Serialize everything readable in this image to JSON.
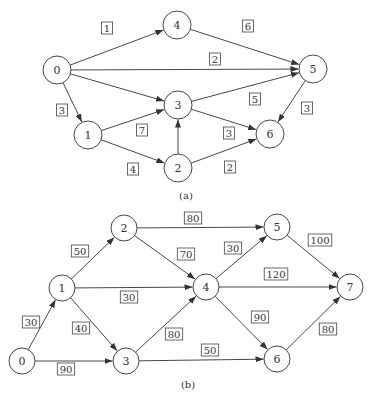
{
  "diagrams": [
    {
      "caption": "(a)",
      "caption_pos": [
        186,
        195
      ],
      "node_radius": 14,
      "nodes": [
        {
          "id": "0",
          "label": "0",
          "x": 57,
          "y": 70
        },
        {
          "id": "1",
          "label": "1",
          "x": 88,
          "y": 135
        },
        {
          "id": "2",
          "label": "2",
          "x": 178,
          "y": 168
        },
        {
          "id": "3",
          "label": "3",
          "x": 178,
          "y": 105
        },
        {
          "id": "4",
          "label": "4",
          "x": 177,
          "y": 25
        },
        {
          "id": "5",
          "label": "5",
          "x": 313,
          "y": 69
        },
        {
          "id": "6",
          "label": "6",
          "x": 270,
          "y": 134
        }
      ],
      "edges": [
        {
          "from": "0",
          "to": "4",
          "weight": "1",
          "lx": 107,
          "ly": 28
        },
        {
          "from": "4",
          "to": "5",
          "weight": "6",
          "lx": 248,
          "ly": 26
        },
        {
          "from": "0",
          "to": "5",
          "weight": "2",
          "lx": 215,
          "ly": 59
        },
        {
          "from": "0",
          "to": "1",
          "weight": "3",
          "lx": 62,
          "ly": 110
        },
        {
          "from": "0",
          "to": "3",
          "weight": "",
          "lx": 0,
          "ly": 0
        },
        {
          "from": "1",
          "to": "3",
          "weight": "7",
          "lx": 142,
          "ly": 130
        },
        {
          "from": "1",
          "to": "2",
          "weight": "4",
          "lx": 133,
          "ly": 169
        },
        {
          "from": "2",
          "to": "3",
          "weight": "",
          "lx": 0,
          "ly": 0
        },
        {
          "from": "3",
          "to": "5",
          "weight": "5",
          "lx": 255,
          "ly": 99
        },
        {
          "from": "3",
          "to": "6",
          "weight": "3",
          "lx": 229,
          "ly": 133
        },
        {
          "from": "5",
          "to": "6",
          "weight": "3",
          "lx": 307,
          "ly": 108
        },
        {
          "from": "2",
          "to": "6",
          "weight": "2",
          "lx": 230,
          "ly": 167
        }
      ]
    },
    {
      "caption": "(b)",
      "caption_pos": [
        188,
        384
      ],
      "node_radius": 13,
      "nodes": [
        {
          "id": "0",
          "label": "0",
          "x": 22,
          "y": 361
        },
        {
          "id": "1",
          "label": "1",
          "x": 62,
          "y": 288
        },
        {
          "id": "2",
          "label": "2",
          "x": 124,
          "y": 228
        },
        {
          "id": "3",
          "label": "3",
          "x": 126,
          "y": 361
        },
        {
          "id": "4",
          "label": "4",
          "x": 206,
          "y": 287
        },
        {
          "id": "5",
          "label": "5",
          "x": 277,
          "y": 227
        },
        {
          "id": "6",
          "label": "6",
          "x": 277,
          "y": 359
        },
        {
          "id": "7",
          "label": "7",
          "x": 350,
          "y": 287
        }
      ],
      "edges": [
        {
          "from": "0",
          "to": "1",
          "weight": "30",
          "lx": 31,
          "ly": 322
        },
        {
          "from": "0",
          "to": "3",
          "weight": "90",
          "lx": 66,
          "ly": 369
        },
        {
          "from": "1",
          "to": "2",
          "weight": "50",
          "lx": 80,
          "ly": 251
        },
        {
          "from": "1",
          "to": "4",
          "weight": "30",
          "lx": 129,
          "ly": 297
        },
        {
          "from": "1",
          "to": "3",
          "weight": "40",
          "lx": 81,
          "ly": 328
        },
        {
          "from": "2",
          "to": "5",
          "weight": "80",
          "lx": 193,
          "ly": 218
        },
        {
          "from": "2",
          "to": "4",
          "weight": "70",
          "lx": 186,
          "ly": 254
        },
        {
          "from": "3",
          "to": "4",
          "weight": "80",
          "lx": 174,
          "ly": 334
        },
        {
          "from": "3",
          "to": "6",
          "weight": "50",
          "lx": 210,
          "ly": 350
        },
        {
          "from": "4",
          "to": "5",
          "weight": "30",
          "lx": 233,
          "ly": 248
        },
        {
          "from": "4",
          "to": "7",
          "weight": "120",
          "lx": 276,
          "ly": 274
        },
        {
          "from": "4",
          "to": "6",
          "weight": "90",
          "lx": 260,
          "ly": 317
        },
        {
          "from": "5",
          "to": "7",
          "weight": "100",
          "lx": 320,
          "ly": 240
        },
        {
          "from": "6",
          "to": "7",
          "weight": "80",
          "lx": 328,
          "ly": 329
        }
      ]
    }
  ]
}
